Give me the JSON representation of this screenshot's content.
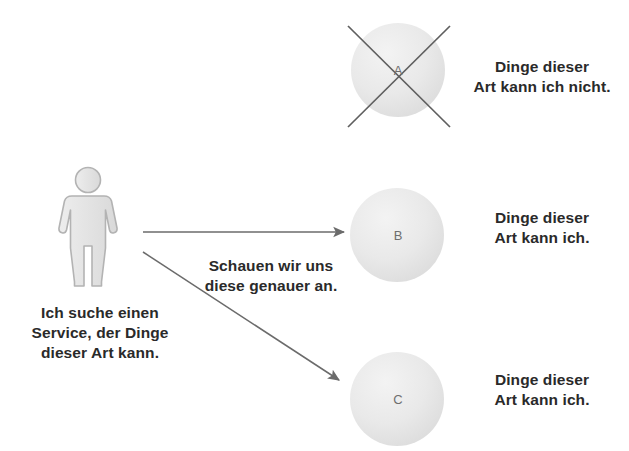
{
  "diagram": {
    "type": "service-discovery-illustration",
    "language": "de",
    "background_color": "#ffffff",
    "text_color": "#2a2a2a",
    "line_color": "#6b6b6b",
    "circle_fill": "#e9e9e9",
    "person_fill": "#e8e8e8",
    "person_stroke": "#b0b0b0"
  },
  "person": {
    "icon": "person-icon",
    "caption": "Ich suche einen\nService, der Dinge\ndieser Art kann."
  },
  "arrows": [
    {
      "id": "arrow-to-b",
      "shape": "horizontal",
      "from": {
        "x": 143,
        "y": 232
      },
      "to": {
        "x": 346,
        "y": 232
      },
      "label": ""
    },
    {
      "id": "arrow-to-c",
      "shape": "diagonal",
      "from": {
        "x": 143,
        "y": 252
      },
      "to": {
        "x": 341,
        "y": 381
      },
      "label": ""
    }
  ],
  "arrow_caption": "Schauen wir uns\ndiese genauer an.",
  "nodes": [
    {
      "id": "node-a",
      "letter": "A",
      "crossed_out": true,
      "center": {
        "x": 398,
        "y": 70
      },
      "radius": 47,
      "label": "Dinge dieser\nArt kann ich nicht."
    },
    {
      "id": "node-b",
      "letter": "B",
      "crossed_out": false,
      "center": {
        "x": 397,
        "y": 235
      },
      "radius": 47,
      "label": "Dinge dieser\nArt kann ich."
    },
    {
      "id": "node-c",
      "letter": "C",
      "crossed_out": false,
      "center": {
        "x": 397,
        "y": 399
      },
      "radius": 47,
      "label": "Dinge dieser\nArt kann ich."
    }
  ]
}
